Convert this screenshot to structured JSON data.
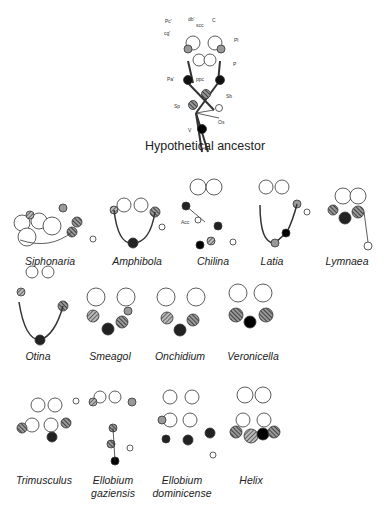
{
  "ancestor": {
    "title": "Hypothetical ancestor",
    "abbreviations": [
      "Pc'",
      "db'",
      "scc",
      "C",
      "cg'",
      "Pl",
      "P",
      "Pa'",
      "ppc",
      "Sb",
      "Sp",
      "Os",
      "V"
    ]
  },
  "taxa": [
    {
      "label": "Siphonaria"
    },
    {
      "label": "Amphibola"
    },
    {
      "label": "Chilina",
      "extra_label": "Acc"
    },
    {
      "label": "Latia"
    },
    {
      "label": "Lymnaea"
    },
    {
      "label": "Otina"
    },
    {
      "label": "Smeagol"
    },
    {
      "label": "Onchidium"
    },
    {
      "label": "Veronicella"
    },
    {
      "label": "Trimusculus"
    },
    {
      "label": "Ellobium",
      "label2": "gaziensis"
    },
    {
      "label": "Ellobium",
      "label2": "dominicense"
    },
    {
      "label": "Helix"
    }
  ]
}
